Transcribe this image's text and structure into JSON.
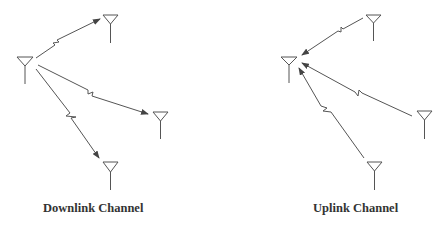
{
  "diagrams": [
    {
      "id": "downlink",
      "caption": "Downlink Channel",
      "direction": "base-to-users",
      "base_station": {
        "x": 25,
        "y": 57
      },
      "users": [
        {
          "x": 110,
          "y": 15
        },
        {
          "x": 160,
          "y": 112
        },
        {
          "x": 110,
          "y": 162
        }
      ]
    },
    {
      "id": "uplink",
      "caption": "Uplink Channel",
      "direction": "users-to-base",
      "base_station": {
        "x": 289,
        "y": 57
      },
      "users": [
        {
          "x": 373,
          "y": 15
        },
        {
          "x": 424,
          "y": 111
        },
        {
          "x": 374,
          "y": 162
        }
      ]
    }
  ],
  "colors": {
    "line": "#555555",
    "text": "#333333",
    "background": "#ffffff"
  }
}
